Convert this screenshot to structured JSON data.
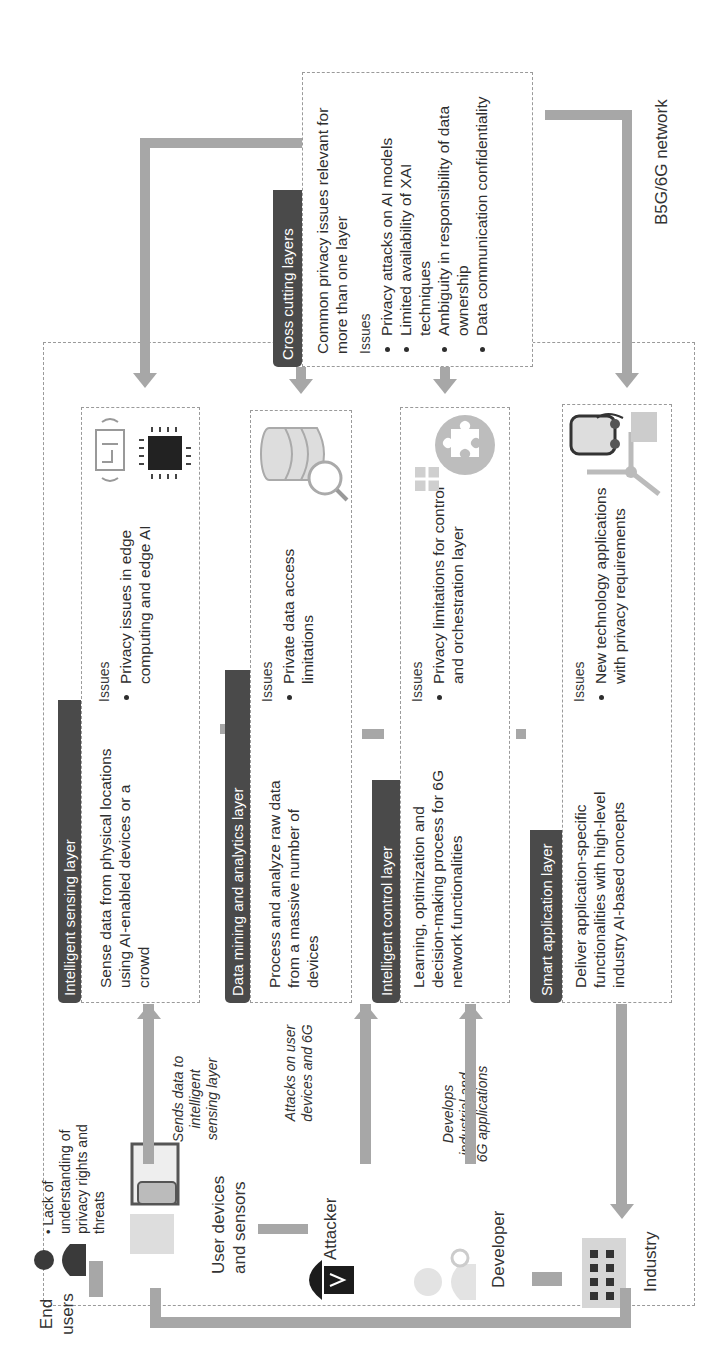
{
  "network": {
    "label": "B5G/6G network"
  },
  "layers": [
    {
      "title": "Intelligent sensing layer",
      "description": "Sense data from physical locations using AI-enabled devices or a crowd",
      "issues_title": "Issues",
      "issues": [
        "Privacy issues in edge computing and edge AI"
      ],
      "icon": "circuit-board-and-chip-icon"
    },
    {
      "title": "Data mining and analytics layer",
      "description": "Process and analyze raw data from a massive number of devices",
      "issues_title": "Issues",
      "issues": [
        "Private data access limitations"
      ],
      "icon": "database-search-icon"
    },
    {
      "title": "Intelligent control layer",
      "description": "Learning, optimization and decision-making process for 6G network functionalities",
      "issues_title": "Issues",
      "issues": [
        "Privacy limitations for control and orchestration layer"
      ],
      "icon": "brain-puzzle-icon"
    },
    {
      "title": "Smart application layer",
      "description": "Deliver application-specific functionalities with high-level industry AI-based concepts",
      "issues_title": "Issues",
      "issues": [
        "New technology applications with privacy requirements"
      ],
      "icon": "wind-turbine-ev-icon"
    }
  ],
  "cross_cutting": {
    "title": "Cross cutting layers",
    "description": "Common privacy issues relevant for more than one layer",
    "issues_title": "Issues",
    "issues": [
      "Privacy attacks on AI models",
      "Limited availability of XAI techniques",
      "Ambiguity in responsibility of data ownership",
      "Data communication confidentiality"
    ]
  },
  "actors": {
    "end_users": {
      "label": "End users",
      "issue": "Lack of understanding of privacy rights and threats"
    },
    "user_devices": {
      "label": "User devices and sensors",
      "arrow_label": "Sends data to intelligent sensing layer"
    },
    "attacker": {
      "label": "Attacker",
      "arrow_label": "Attacks on user devices and 6G"
    },
    "developer": {
      "label": "Developer",
      "arrow_label": "Develops industrial and 6G applications"
    },
    "industry": {
      "label": "Industry"
    }
  },
  "colors": {
    "tab_bg": "#4a4a4a",
    "arrow": "#a7a7a7",
    "border": "#9a9a9a",
    "text": "#2e2e2e"
  }
}
